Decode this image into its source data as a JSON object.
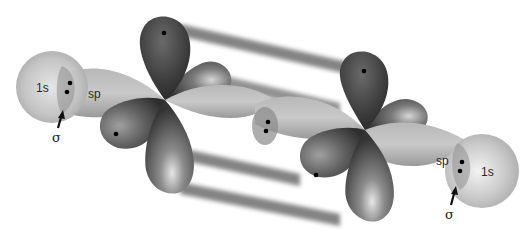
{
  "diagram": {
    "colors": {
      "background": "#ffffff",
      "s_orbital": "#bdbdbd",
      "sp_orbital": "#a9a9a9",
      "p_orbital_dark": "#3a3a3a",
      "p_orbital_light": "#cfcfcf",
      "pi_bar": "#777777",
      "electron_dot": "#000000"
    },
    "labels": {
      "left_1s": "1s",
      "left_sp": "sp",
      "left_sigma": "σ",
      "right_sp": "sp",
      "right_1s": "1s",
      "right_sigma": "σ"
    }
  }
}
